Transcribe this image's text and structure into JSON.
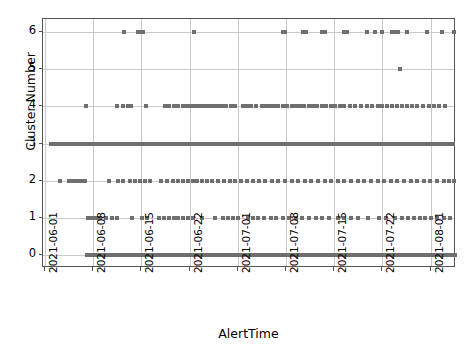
{
  "chart_data": {
    "type": "scatter",
    "title": "",
    "xlabel": "AlertTime",
    "ylabel": "Cluster Number",
    "grid": true,
    "legend": null,
    "marker": {
      "shape": "square",
      "color": "#6f6f6f",
      "size": 4
    },
    "ylim": [
      -0.35,
      6.35
    ],
    "yticks": [
      0,
      1,
      2,
      3,
      4,
      5,
      6
    ],
    "ytick_labels": [
      "0",
      "1",
      "2",
      "3",
      "4",
      "5",
      "6"
    ],
    "xlim": [
      "2021-05-31",
      "2021-08-05"
    ],
    "xticks": [
      "2021-06-01",
      "2021-06-08",
      "2021-06-15",
      "2021-06-22",
      "2021-07-01",
      "2021-07-08",
      "2021-07-15",
      "2021-07-22",
      "2021-08-01"
    ],
    "xtick_labels": [
      "2021-06-01",
      "2021-06-08",
      "2021-06-15",
      "2021-06-22",
      "2021-07-01",
      "2021-07-08",
      "2021-07-15",
      "2021-07-22",
      "2021-08-01"
    ],
    "xtick_rotation": 90,
    "series": [
      {
        "name": "cluster-6",
        "y": 6,
        "x_pct": [
          19.5,
          23.0,
          23.6,
          24.2,
          36.5,
          58.0,
          58.6,
          63.0,
          63.6,
          67.5,
          68.2,
          73.0,
          73.6,
          78.5,
          80.5,
          82.0,
          84.5,
          85.2,
          86.0,
          88.2,
          93.0,
          96.5,
          99.4
        ]
      },
      {
        "name": "cluster-5",
        "y": 5,
        "x_pct": [
          86.5
        ]
      },
      {
        "name": "cluster-4",
        "y": 4,
        "x_pct": [
          10.5,
          18.0,
          19.4,
          20.6,
          21.4,
          25.0,
          29.6,
          30.6,
          31.6,
          32.8,
          33.8,
          34.6,
          35.4,
          36.2,
          37.0,
          37.8,
          38.6,
          39.4,
          40.2,
          41.0,
          41.8,
          42.6,
          43.4,
          44.4,
          45.4,
          46.4,
          48.4,
          49.4,
          50.4,
          51.6,
          53.0,
          54.0,
          55.0,
          56.0,
          57.0,
          58.2,
          59.2,
          60.2,
          61.2,
          62.2,
          63.2,
          64.4,
          65.4,
          66.4,
          67.6,
          68.6,
          69.8,
          70.8,
          71.8,
          73.0,
          74.4,
          75.6,
          77.0,
          78.4,
          79.6,
          81.0,
          82.2,
          83.4,
          84.6,
          85.8,
          87.0,
          88.2,
          89.4,
          90.6,
          92.0,
          93.4,
          94.6,
          96.0,
          97.4
        ]
      },
      {
        "name": "cluster-3",
        "y": 3,
        "x_pct": [
          2.0,
          3.0,
          4.0,
          5.0,
          6.0,
          7.2,
          8.4,
          10.8,
          11.8,
          13.0,
          14.0,
          15.2,
          16.2,
          17.4,
          18.4,
          19.4,
          20.4,
          21.4,
          22.4,
          23.4,
          24.4,
          25.4,
          26.4,
          27.4,
          28.4,
          29.4,
          30.4,
          31.4,
          32.4,
          33.4,
          34.4,
          35.4,
          36.4,
          37.4,
          38.4,
          39.4,
          40.4,
          41.4,
          42.4,
          43.4,
          44.4,
          45.4,
          46.4,
          47.4,
          48.4,
          49.4,
          50.4,
          51.4,
          52.4,
          53.4,
          54.4,
          55.4,
          56.4,
          57.4,
          58.4,
          59.4,
          60.4,
          61.4,
          62.4,
          63.4,
          64.4,
          65.4,
          66.4,
          67.4,
          68.4,
          69.4,
          70.4,
          71.4,
          72.4,
          73.4,
          74.4,
          75.4,
          76.4,
          77.4,
          78.4,
          79.4,
          80.4,
          81.4,
          82.4,
          83.4,
          84.4,
          85.4,
          86.4,
          87.4,
          88.4,
          89.4,
          90.4,
          91.4,
          92.4,
          93.4,
          94.4,
          95.4,
          96.4,
          97.4,
          98.4,
          99.2
        ]
      },
      {
        "name": "cluster-2",
        "y": 2,
        "x_pct": [
          4.0,
          6.2,
          7.2,
          8.2,
          9.2,
          10.2,
          16.0,
          18.2,
          19.4,
          21.0,
          22.2,
          23.4,
          24.6,
          26.0,
          28.6,
          30.0,
          31.4,
          32.6,
          33.8,
          35.0,
          36.2,
          37.4,
          38.6,
          39.8,
          41.0,
          42.4,
          43.8,
          45.2,
          46.6,
          48.0,
          49.4,
          50.8,
          52.2,
          53.8,
          55.4,
          57.0,
          58.6,
          60.2,
          61.8,
          63.4,
          65.0,
          66.6,
          68.2,
          69.8,
          71.4,
          73.0,
          74.6,
          76.2,
          77.8,
          79.4,
          81.0,
          82.6,
          84.2,
          85.8,
          87.4,
          89.0,
          90.6,
          92.2,
          93.8,
          95.4,
          97.0,
          98.4,
          99.4
        ]
      },
      {
        "name": "cluster-1",
        "y": 1,
        "x_pct": [
          10.8,
          11.8,
          12.8,
          13.8,
          15.2,
          16.8,
          17.8,
          21.6,
          24.0,
          25.2,
          28.0,
          29.2,
          30.4,
          31.6,
          32.8,
          34.0,
          35.2,
          36.4,
          38.6,
          41.6,
          43.6,
          44.8,
          46.0,
          47.2,
          49.6,
          50.8,
          52.0,
          53.6,
          55.2,
          56.4,
          58.0,
          59.6,
          61.2,
          62.8,
          64.4,
          66.0,
          67.6,
          69.2,
          71.4,
          73.0,
          74.6,
          76.2,
          78.8,
          81.4,
          83.0,
          85.2,
          87.0,
          88.4,
          89.8,
          91.2,
          92.6,
          94.0,
          95.4,
          97.0,
          98.6
        ]
      },
      {
        "name": "cluster-0",
        "y": 0,
        "x_pct": [
          10.6,
          11.4,
          12.2,
          13.0,
          14.0,
          15.0,
          16.0,
          17.0,
          18.0,
          19.0,
          20.0,
          21.0,
          22.0,
          23.0,
          24.0,
          25.0,
          26.0,
          27.0,
          28.0,
          29.0,
          30.0,
          31.0,
          32.0,
          33.0,
          34.0,
          35.0,
          36.0,
          37.0,
          38.0,
          39.0,
          40.0,
          41.0,
          42.0,
          43.0,
          44.0,
          45.0,
          46.0,
          47.0,
          48.0,
          49.0,
          50.0,
          51.0,
          52.0,
          53.0,
          54.0,
          55.0,
          56.0,
          57.0,
          58.0,
          59.0,
          60.0,
          61.0,
          62.0,
          63.0,
          64.0,
          65.0,
          66.0,
          67.0,
          68.0,
          69.0,
          70.0,
          71.0,
          72.0,
          73.0,
          74.0,
          75.0,
          76.0,
          77.0,
          78.0,
          79.0,
          80.0,
          81.0,
          82.0,
          83.0,
          84.0,
          85.0,
          86.0,
          87.0,
          88.0,
          89.0,
          90.0,
          91.0,
          92.0,
          93.0,
          94.0,
          95.0,
          96.0,
          97.0,
          98.0,
          99.0,
          99.8
        ]
      }
    ]
  }
}
